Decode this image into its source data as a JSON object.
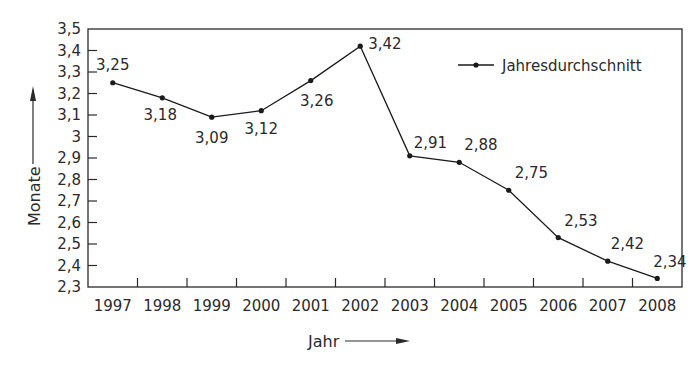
{
  "chart_data": {
    "type": "line",
    "title": "",
    "xlabel": "Jahr",
    "ylabel": "Monate",
    "x": [
      "1997",
      "1998",
      "1999",
      "2000",
      "2001",
      "2002",
      "2003",
      "2004",
      "2005",
      "2006",
      "2007",
      "2008"
    ],
    "series": [
      {
        "name": "Jahresdurchschnitt",
        "values": [
          3.25,
          3.18,
          3.09,
          3.12,
          3.26,
          3.42,
          2.91,
          2.88,
          2.75,
          2.53,
          2.42,
          2.34
        ],
        "labels": [
          "3,25",
          "3,18",
          "3,09",
          "3,12",
          "3,26",
          "3,42",
          "2,91",
          "2,88",
          "2,75",
          "2,53",
          "2,42",
          "2,34"
        ]
      }
    ],
    "ylim": [
      2.3,
      3.5
    ],
    "yticks": [
      "2,3",
      "2,4",
      "2,5",
      "2,6",
      "2,7",
      "2,8",
      "2,9",
      "3",
      "3,1",
      "3,2",
      "3,3",
      "3,4",
      "3,5"
    ],
    "grid": false,
    "legend_position": "top-right",
    "colors": {
      "line": "#1a1a1a",
      "frame": "#2a2a2a",
      "text": "#2a2a2a"
    }
  }
}
